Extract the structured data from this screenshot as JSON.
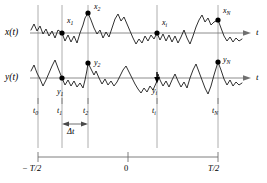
{
  "figure": {
    "type": "time-series-sampling-diagram",
    "background_color": "#ffffff",
    "line_color": "#1a1a1a",
    "grid_color": "#9a9a9a",
    "marker_color": "#000000"
  },
  "signals": {
    "x": {
      "axis_label": "x(t)",
      "axis_name": "t",
      "baseline_y": 33,
      "samples": [
        {
          "label": "x",
          "sub": "1",
          "x": 62,
          "y": 33
        },
        {
          "label": "x",
          "sub": "2",
          "x": 88,
          "y": 13
        },
        {
          "label": "x",
          "sub": "i",
          "x": 157,
          "y": 33
        },
        {
          "label": "x",
          "sub": "N",
          "x": 218,
          "y": 20
        }
      ]
    },
    "y": {
      "axis_label": "y(t)",
      "axis_name": "t",
      "baseline_y": 78,
      "samples": [
        {
          "label": "y",
          "sub": "1",
          "x": 62,
          "y": 78
        },
        {
          "label": "y",
          "sub": "2",
          "x": 88,
          "y": 63
        },
        {
          "label": "y",
          "sub": "i",
          "x": 157,
          "y": 81
        },
        {
          "label": "y",
          "sub": "N",
          "x": 218,
          "y": 62
        }
      ]
    }
  },
  "gridlines": [
    {
      "name": "t0",
      "x": 38
    },
    {
      "name": "t1",
      "x": 62
    },
    {
      "name": "t2",
      "x": 88
    },
    {
      "name": "ti",
      "x": 157
    },
    {
      "name": "tN",
      "x": 218
    }
  ],
  "time_ticks": [
    {
      "label": "t",
      "sub": "0",
      "x": 38
    },
    {
      "label": "t",
      "sub": "1",
      "x": 62
    },
    {
      "label": "t",
      "sub": "2",
      "x": 88
    },
    {
      "label": "t",
      "sub": "i",
      "x": 157
    },
    {
      "label": "t",
      "sub": "N",
      "x": 218
    }
  ],
  "interval": {
    "label": "Δt",
    "from_x": 62,
    "to_x": 88,
    "arrow_y": 124,
    "label_x": 75,
    "label_y": 131
  },
  "scale_axis": {
    "y": 157,
    "left_x": 38,
    "right_x": 218,
    "center_x": 128,
    "ticks": [
      {
        "label": "− T/2",
        "x": 38
      },
      {
        "label": "0",
        "x": 128
      },
      {
        "label": "T/2",
        "x": 218
      }
    ]
  }
}
